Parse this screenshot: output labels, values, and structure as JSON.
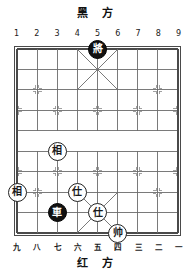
{
  "meta": {
    "game": "xiangqi",
    "board_files": 9,
    "board_ranks": 10
  },
  "captions": {
    "black_side": "黑 方",
    "red_side": "红 方"
  },
  "coordinates": {
    "top": [
      "1",
      "2",
      "3",
      "4",
      "5",
      "6",
      "7",
      "8",
      "9"
    ],
    "bottom": [
      "九",
      "八",
      "七",
      "六",
      "五",
      "四",
      "三",
      "二",
      "一"
    ]
  },
  "colors": {
    "board_line": "#6b6b6b",
    "board_border": "#4a4a4a",
    "piece_red_fill": "#ffffff",
    "piece_red_text": "#1a1a1a",
    "piece_black_fill": "#111111",
    "piece_black_text": "#ffffff",
    "background": "#ffffff"
  },
  "pieces": [
    {
      "id": "p1",
      "glyph": "將",
      "side": "black",
      "name": "black-general",
      "file": 5,
      "rank": 0
    },
    {
      "id": "p2",
      "glyph": "相",
      "side": "red",
      "name": "red-elephant-left",
      "file": 3,
      "rank": 5
    },
    {
      "id": "p3",
      "glyph": "相",
      "side": "red",
      "name": "red-elephant-edge",
      "file": 1,
      "rank": 7
    },
    {
      "id": "p4",
      "glyph": "仕",
      "side": "red",
      "name": "red-advisor-upper",
      "file": 4,
      "rank": 7
    },
    {
      "id": "p5",
      "glyph": "車",
      "side": "black",
      "name": "black-chariot",
      "file": 3,
      "rank": 8
    },
    {
      "id": "p6",
      "glyph": "仕",
      "side": "red",
      "name": "red-advisor-lower",
      "file": 5,
      "rank": 8
    },
    {
      "id": "p7",
      "glyph": "帅",
      "side": "red",
      "name": "red-marshal",
      "file": 6,
      "rank": 9
    }
  ],
  "star_points": [
    {
      "file": 2,
      "rank": 2
    },
    {
      "file": 8,
      "rank": 2
    },
    {
      "file": 1,
      "rank": 3
    },
    {
      "file": 3,
      "rank": 3
    },
    {
      "file": 5,
      "rank": 3
    },
    {
      "file": 7,
      "rank": 3
    },
    {
      "file": 9,
      "rank": 3
    },
    {
      "file": 1,
      "rank": 6
    },
    {
      "file": 3,
      "rank": 6
    },
    {
      "file": 5,
      "rank": 6
    },
    {
      "file": 7,
      "rank": 6
    },
    {
      "file": 9,
      "rank": 6
    },
    {
      "file": 2,
      "rank": 7
    },
    {
      "file": 8,
      "rank": 7
    }
  ]
}
